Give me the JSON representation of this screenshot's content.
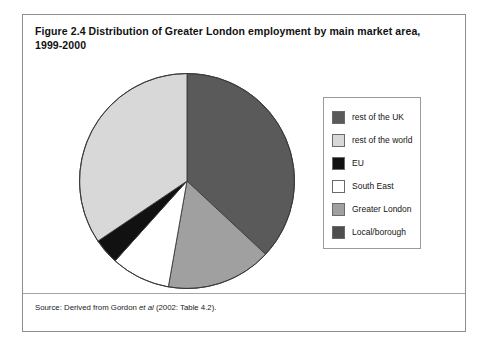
{
  "figure": {
    "title": "Figure 2.4 Distribution of Greater London employment by main market area, 1999-2000",
    "source_prefix": "Source: Derived from Gordon ",
    "source_italic": "et al",
    "source_suffix": " (2002: Table 4.2)."
  },
  "legend": {
    "items": [
      {
        "label": "rest of the UK",
        "color": "#5a5a5a"
      },
      {
        "label": "rest of the world",
        "color": "#d8d8d8"
      },
      {
        "label": "EU",
        "color": "#111111"
      },
      {
        "label": "South East",
        "color": "#ffffff"
      },
      {
        "label": "Greater London",
        "color": "#a0a0a0"
      },
      {
        "label": "Local/borough",
        "color": "#4e4e4e"
      }
    ]
  },
  "chart_data": {
    "type": "pie",
    "title": "Figure 2.4 Distribution of Greater London employment by main market area, 1999-2000",
    "legend_position": "right",
    "grid": false,
    "categories": [
      "rest of the UK",
      "rest of the world",
      "EU",
      "South East",
      "Greater London",
      "Local/borough"
    ],
    "values": [
      37,
      34,
      4,
      9,
      16,
      0
    ],
    "units": "percent",
    "slice_colors": [
      "#5a5a5a",
      "#d8d8d8",
      "#111111",
      "#ffffff",
      "#a0a0a0",
      "#4e4e4e"
    ],
    "slices": [
      {
        "label": "rest of the UK",
        "value": 37,
        "color": "#5a5a5a",
        "start_deg": 0,
        "end_deg": 133
      },
      {
        "label": "Greater London",
        "value": 16,
        "color": "#a0a0a0",
        "start_deg": 133,
        "end_deg": 190
      },
      {
        "label": "South East",
        "value": 9,
        "color": "#ffffff",
        "start_deg": 190,
        "end_deg": 222
      },
      {
        "label": "EU",
        "value": 4,
        "color": "#111111",
        "start_deg": 222,
        "end_deg": 236
      },
      {
        "label": "rest of the world",
        "value": 34,
        "color": "#d8d8d8",
        "start_deg": 236,
        "end_deg": 360
      }
    ]
  }
}
